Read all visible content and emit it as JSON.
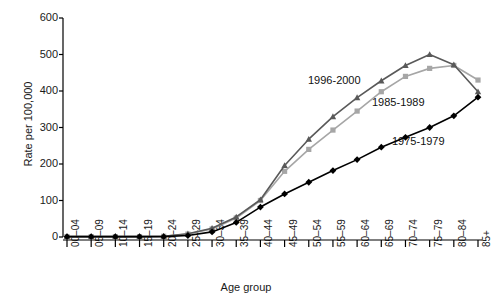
{
  "chart_data": {
    "type": "line",
    "title": "",
    "xlabel": "Age group",
    "ylabel": "Rate per 100,000",
    "ylim": [
      0,
      600
    ],
    "yticks": [
      0,
      100,
      200,
      300,
      400,
      500,
      600
    ],
    "grid": false,
    "legend_position": "inline-annotations",
    "categories": [
      "00–04",
      "05–09",
      "10–14",
      "15–19",
      "20–24",
      "25–29",
      "30–34",
      "35–39",
      "40–44",
      "45–49",
      "50–54",
      "55–59",
      "60–64",
      "65–69",
      "70–74",
      "75–79",
      "80–84",
      "85+"
    ],
    "series": [
      {
        "name": "1975-1979",
        "color": "#000000",
        "marker": "diamond",
        "values": [
          1,
          1,
          1,
          1,
          1,
          4,
          14,
          40,
          82,
          118,
          150,
          182,
          212,
          246,
          273,
          300,
          332,
          383
        ]
      },
      {
        "name": "1985-1989",
        "color": "#a6a6a6",
        "marker": "square",
        "values": [
          1,
          1,
          1,
          1,
          2,
          8,
          22,
          52,
          100,
          180,
          240,
          293,
          345,
          398,
          440,
          462,
          470,
          430
        ]
      },
      {
        "name": "1996-2000",
        "color": "#595959",
        "marker": "triangle",
        "values": [
          1,
          1,
          1,
          1,
          2,
          9,
          24,
          55,
          102,
          196,
          268,
          330,
          382,
          428,
          470,
          500,
          472,
          398
        ]
      }
    ],
    "annotations": [
      {
        "text": "1996-2000",
        "x_px": 308,
        "y_px": 74
      },
      {
        "text": "1985-1989",
        "x_px": 372,
        "y_px": 96
      },
      {
        "text": "1975-1979",
        "x_px": 392,
        "y_px": 135
      }
    ]
  },
  "axis": {
    "ytick_labels": [
      "600",
      "500",
      "400",
      "300",
      "200",
      "100",
      "0"
    ],
    "xtick_labels": [
      "00–04",
      "05–09",
      "10–14",
      "15–19",
      "20–24",
      "25–29",
      "30–34",
      "35–39",
      "40–44",
      "45–49",
      "50–54",
      "55–59",
      "60–64",
      "65–69",
      "70–74",
      "75–79",
      "80–84",
      "85+"
    ],
    "ylabel": "Rate per 100,000",
    "xlabel": "Age group"
  }
}
